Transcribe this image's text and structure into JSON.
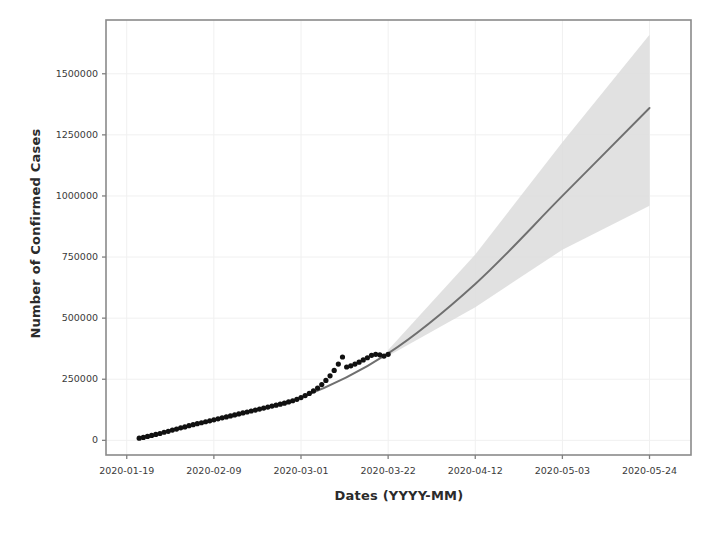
{
  "chart_data": {
    "type": "line",
    "title": "",
    "xlabel": "Dates (YYYY-MM)",
    "ylabel": "Number of Confirmed Cases",
    "grid": true,
    "legend": "none",
    "ylim": [
      -60000,
      1720000
    ],
    "yticks": [
      0,
      250000,
      500000,
      750000,
      1000000,
      1250000,
      1500000
    ],
    "ytick_labels": [
      "0",
      "250000",
      "500000",
      "750000",
      "1000000",
      "1250000",
      "1500000"
    ],
    "xticks": [
      "2020-01-19",
      "2020-02-09",
      "2020-03-01",
      "2020-03-22",
      "2020-04-12",
      "2020-05-03",
      "2020-05-24"
    ],
    "xtick_labels": [
      "2020-01-19",
      "2020-02-09",
      "2020-03-01",
      "2020-03-22",
      "2020-04-12",
      "2020-05-03",
      "2020-05-24"
    ],
    "xlim": [
      "2020-01-14",
      "2020-06-03"
    ],
    "colors": {
      "fit_line": "#6f6f6f",
      "observed_points": "#111111",
      "confidence_band": "#d9d9d9",
      "axis": "#808080",
      "grid": "#f0f0f0",
      "text": "#2b2b2b"
    },
    "series": [
      {
        "name": "Observed confirmed cases",
        "type": "scatter",
        "marker": "circle",
        "x": [
          "2020-01-22",
          "2020-01-23",
          "2020-01-24",
          "2020-01-25",
          "2020-01-26",
          "2020-01-27",
          "2020-01-28",
          "2020-01-29",
          "2020-01-30",
          "2020-01-31",
          "2020-02-01",
          "2020-02-02",
          "2020-02-03",
          "2020-02-04",
          "2020-02-05",
          "2020-02-06",
          "2020-02-07",
          "2020-02-08",
          "2020-02-09",
          "2020-02-10",
          "2020-02-11",
          "2020-02-12",
          "2020-02-13",
          "2020-02-14",
          "2020-02-15",
          "2020-02-16",
          "2020-02-17",
          "2020-02-18",
          "2020-02-19",
          "2020-02-20",
          "2020-02-21",
          "2020-02-22",
          "2020-02-23",
          "2020-02-24",
          "2020-02-25",
          "2020-02-26",
          "2020-02-27",
          "2020-02-28",
          "2020-02-29",
          "2020-03-01",
          "2020-03-02",
          "2020-03-03",
          "2020-03-04",
          "2020-03-05",
          "2020-03-06",
          "2020-03-07",
          "2020-03-08",
          "2020-03-09",
          "2020-03-10",
          "2020-03-11",
          "2020-03-12",
          "2020-03-13",
          "2020-03-14",
          "2020-03-15",
          "2020-03-16",
          "2020-03-17",
          "2020-03-18",
          "2020-03-19",
          "2020-03-20",
          "2020-03-21",
          "2020-03-22"
        ],
        "y": [
          9000,
          12000,
          16000,
          20000,
          24000,
          28000,
          33000,
          37000,
          42000,
          46000,
          51000,
          55000,
          60000,
          64000,
          68000,
          72000,
          76000,
          80000,
          84000,
          88000,
          92000,
          96000,
          100000,
          104000,
          108000,
          112000,
          116000,
          120000,
          124000,
          128000,
          132000,
          136000,
          140000,
          144000,
          148000,
          152000,
          157000,
          162000,
          168000,
          175000,
          183000,
          192000,
          202000,
          214000,
          228000,
          245000,
          264000,
          286000,
          312000,
          341000,
          300000,
          305000,
          312000,
          320000,
          329000,
          338000,
          348000,
          352000,
          350000,
          345000,
          352000
        ]
      },
      {
        "name": "Fitted / forecast curve",
        "type": "line",
        "x": [
          "2020-01-22",
          "2020-02-09",
          "2020-03-01",
          "2020-03-22",
          "2020-04-12",
          "2020-05-03",
          "2020-05-24"
        ],
        "y": [
          8000,
          86000,
          176000,
          356000,
          640000,
          1000000,
          1360000
        ]
      },
      {
        "name": "Forecast confidence band (upper)",
        "type": "band-upper",
        "x": [
          "2020-03-22",
          "2020-04-12",
          "2020-05-03",
          "2020-05-24"
        ],
        "y": [
          370000,
          760000,
          1220000,
          1660000
        ]
      },
      {
        "name": "Forecast confidence band (lower)",
        "type": "band-lower",
        "x": [
          "2020-03-22",
          "2020-04-12",
          "2020-05-03",
          "2020-05-24"
        ],
        "y": [
          345000,
          545000,
          780000,
          960000
        ]
      }
    ]
  },
  "axes": {
    "ylabel": "Number of Confirmed Cases",
    "xlabel": "Dates (YYYY-MM)",
    "yticks": [
      "0",
      "250000",
      "500000",
      "750000",
      "1000000",
      "1250000",
      "1500000"
    ],
    "xticks": [
      "2020-01-19",
      "2020-02-09",
      "2020-03-01",
      "2020-03-22",
      "2020-04-12",
      "2020-05-03",
      "2020-05-24"
    ]
  }
}
